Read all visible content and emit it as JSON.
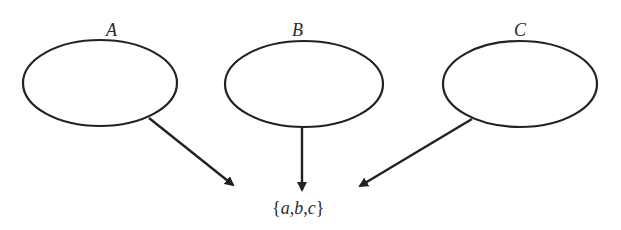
{
  "diagram": {
    "nodes": [
      {
        "id": "A",
        "label": "A",
        "cx": 100,
        "cy": 83,
        "rx": 77,
        "ry": 43
      },
      {
        "id": "B",
        "label": "B",
        "cx": 304,
        "cy": 84,
        "rx": 79,
        "ry": 43
      },
      {
        "id": "C",
        "label": "C",
        "cx": 520,
        "cy": 84,
        "rx": 77,
        "ry": 43
      }
    ],
    "edges": [
      {
        "from": "A",
        "to": "result"
      },
      {
        "from": "B",
        "to": "result"
      },
      {
        "from": "C",
        "to": "result"
      }
    ],
    "result": {
      "open": "{",
      "a": "a",
      "sep1": ",",
      "b": "b",
      "sep2": ",",
      "c": "c",
      "close": "}"
    },
    "colors": {
      "stroke": "#222222",
      "background": "#ffffff"
    }
  }
}
